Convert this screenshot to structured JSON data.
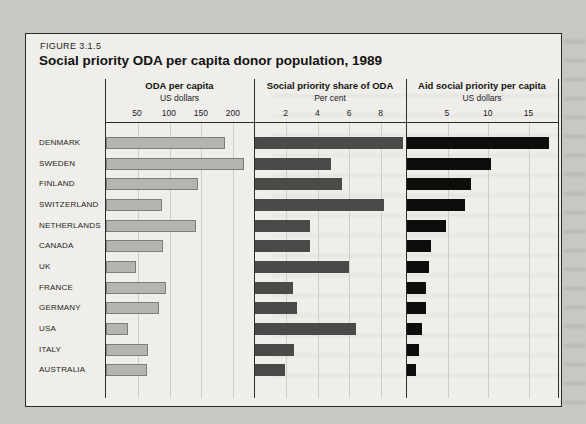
{
  "figure": {
    "label": "FIGURE 3.1.5",
    "title": "Social priority ODA per capita donor population, 1989"
  },
  "colors": {
    "page_background": "#c7c7c3",
    "figure_background": "#efeeea",
    "axis_line": "#2b2b28",
    "gridline": "#cdcdc6",
    "oda_bar_fill": "#b4b4b0",
    "oda_bar_border": "#7e7e78",
    "share_bar_fill": "#4a4a48",
    "aid_bar_fill": "#0d0d0b"
  },
  "chart_data": {
    "type": "bar",
    "orientation": "horizontal",
    "title": "Social priority ODA per capita donor population, 1989",
    "categories": [
      "DENMARK",
      "SWEDEN",
      "FINLAND",
      "SWITZERLAND",
      "NETHERLANDS",
      "CANADA",
      "UK",
      "FRANCE",
      "GERMANY",
      "USA",
      "ITALY",
      "AUSTRALIA"
    ],
    "grid": true,
    "panels": [
      {
        "title": "ODA per capita",
        "unit": "US dollars",
        "ticks": [
          50,
          100,
          150,
          200
        ],
        "xlim": [
          0,
          233
        ],
        "bar_color": "#b4b4b0",
        "bar_border": "#7e7e78",
        "values": [
          188,
          217,
          145,
          88,
          142,
          90,
          48,
          95,
          83,
          34,
          66,
          64
        ]
      },
      {
        "title": "Social priority share of ODA",
        "unit": "Per cent",
        "ticks": [
          2,
          4,
          6,
          8
        ],
        "xlim": [
          0,
          9.6
        ],
        "bar_color": "#4a4a48",
        "bar_border": null,
        "values": [
          9.4,
          4.8,
          5.5,
          8.2,
          3.5,
          3.5,
          6.0,
          2.4,
          2.7,
          6.4,
          2.5,
          1.9
        ]
      },
      {
        "title": "Aid social priority per capita",
        "unit": "US dollars",
        "ticks": [
          5,
          10,
          15
        ],
        "xlim": [
          0,
          18.6
        ],
        "bar_color": "#0d0d0b",
        "bar_border": null,
        "values": [
          17.5,
          10.3,
          7.9,
          7.1,
          4.8,
          2.9,
          2.7,
          2.3,
          2.3,
          1.9,
          1.5,
          1.1
        ]
      }
    ]
  }
}
